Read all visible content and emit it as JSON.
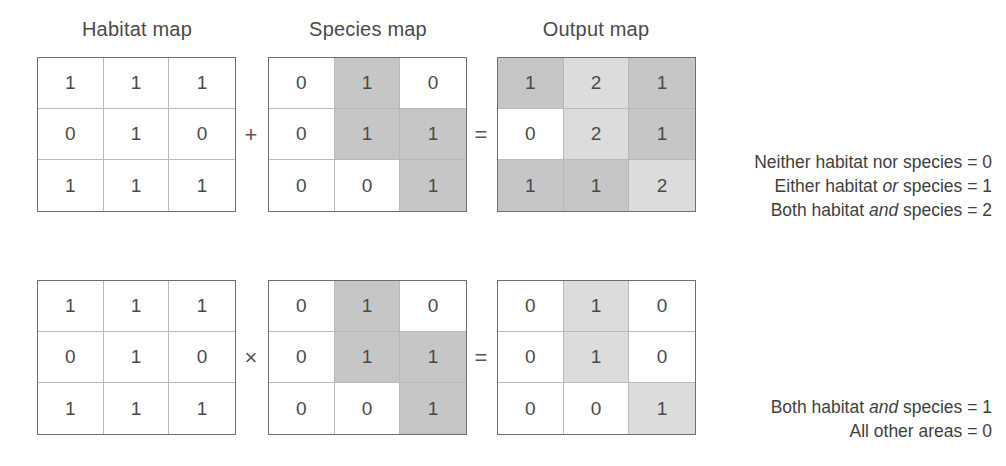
{
  "diagram": {
    "title_habitat": "Habitat map",
    "title_species": "Species map",
    "title_output": "Output map",
    "operator_add": "+",
    "operator_multiply": "×",
    "operator_equals_top": "=",
    "operator_equals_bottom": "="
  },
  "colors": {
    "shade_none": "#ffffff",
    "shade_mid": "#c6c6c6",
    "shade_light": "#dcdcdc",
    "border_outer": "#6e6e6e",
    "border_inner": "#b9b9b9",
    "text": "#3f3f3f"
  },
  "row_addition": {
    "habitat": {
      "values": [
        [
          "1",
          "1",
          "1"
        ],
        [
          "0",
          "1",
          "0"
        ],
        [
          "1",
          "1",
          "1"
        ]
      ],
      "shades": [
        [
          "none",
          "none",
          "none"
        ],
        [
          "none",
          "none",
          "none"
        ],
        [
          "none",
          "none",
          "none"
        ]
      ]
    },
    "species": {
      "values": [
        [
          "0",
          "1",
          "0"
        ],
        [
          "0",
          "1",
          "1"
        ],
        [
          "0",
          "0",
          "1"
        ]
      ],
      "shades": [
        [
          "none",
          "mid",
          "none"
        ],
        [
          "none",
          "mid",
          "mid"
        ],
        [
          "none",
          "none",
          "mid"
        ]
      ]
    },
    "output": {
      "values": [
        [
          "1",
          "2",
          "1"
        ],
        [
          "0",
          "2",
          "1"
        ],
        [
          "1",
          "1",
          "2"
        ]
      ],
      "shades": [
        [
          "mid",
          "light",
          "mid"
        ],
        [
          "none",
          "light",
          "mid"
        ],
        [
          "mid",
          "mid",
          "light"
        ]
      ]
    },
    "legend": [
      {
        "pre": "Neither habitat nor species = 0",
        "em": "",
        "post": ""
      },
      {
        "pre": "Either habitat ",
        "em": "or",
        "post": " species = 1"
      },
      {
        "pre": "Both habitat ",
        "em": "and",
        "post": " species = 2"
      }
    ]
  },
  "row_multiplication": {
    "habitat": {
      "values": [
        [
          "1",
          "1",
          "1"
        ],
        [
          "0",
          "1",
          "0"
        ],
        [
          "1",
          "1",
          "1"
        ]
      ],
      "shades": [
        [
          "none",
          "none",
          "none"
        ],
        [
          "none",
          "none",
          "none"
        ],
        [
          "none",
          "none",
          "none"
        ]
      ]
    },
    "species": {
      "values": [
        [
          "0",
          "1",
          "0"
        ],
        [
          "0",
          "1",
          "1"
        ],
        [
          "0",
          "0",
          "1"
        ]
      ],
      "shades": [
        [
          "none",
          "mid",
          "none"
        ],
        [
          "none",
          "mid",
          "mid"
        ],
        [
          "none",
          "none",
          "mid"
        ]
      ]
    },
    "output": {
      "values": [
        [
          "0",
          "1",
          "0"
        ],
        [
          "0",
          "1",
          "0"
        ],
        [
          "0",
          "0",
          "1"
        ]
      ],
      "shades": [
        [
          "none",
          "light",
          "none"
        ],
        [
          "none",
          "light",
          "none"
        ],
        [
          "none",
          "none",
          "light"
        ]
      ]
    },
    "legend": [
      {
        "pre": "Both habitat ",
        "em": "and",
        "post": " species = 1"
      },
      {
        "pre": "All other areas = 0",
        "em": "",
        "post": ""
      }
    ]
  }
}
